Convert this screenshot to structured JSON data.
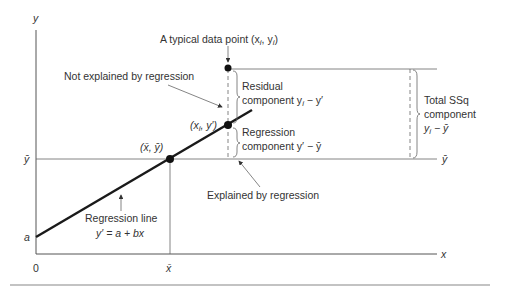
{
  "diagram": {
    "axes": {
      "y_label": "y",
      "x_label": "x",
      "origin_label": "0",
      "intercept_label": "a",
      "ybar_left": "ȳ",
      "ybar_right": "ȳ",
      "xbar": "x̄"
    },
    "labels": {
      "typical_point": "A typical data point (x",
      "typical_point_sub": "i",
      "typical_point_mid": ", y",
      "typical_point_end": ")",
      "not_explained": "Not explained by regression",
      "explained": "Explained by regression",
      "residual_1": "Residual",
      "residual_2": "component y",
      "residual_sub": "i",
      "residual_end": " − y′",
      "regression_1": "Regression",
      "regression_2": "component y′ − ȳ",
      "total_1": "Total SSq",
      "total_2": "component",
      "total_3": "y",
      "total_sub": "i",
      "total_end": " − ȳ",
      "point_xi": "(x",
      "point_xi_sub": "i",
      "point_xi_end": ", y′)",
      "mean_point": "(x̄, ȳ)",
      "reg_line_1": "Regression line",
      "reg_line_2": "y′ = a + bx"
    }
  }
}
